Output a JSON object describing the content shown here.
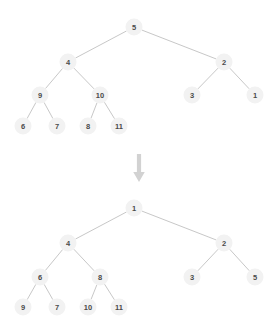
{
  "figure": {
    "background_color": "#ffffff",
    "node_fill_color": "#f2f2f2",
    "node_text_color": "#4a4a4a",
    "edge_color": "#b9b9b9",
    "arrow_color": "#d2d2d2",
    "node_radius": 8.5
  },
  "chart_data": {
    "type": "diagram",
    "title": "",
    "subtitle": "",
    "diagram_kind": "binary-tree-transformation",
    "transition_icon": "down-arrow-icon",
    "trees": [
      {
        "name": "before-tree",
        "root_value": "5",
        "nodes": [
          {
            "id": "t1-5",
            "label": "5",
            "x": 134,
            "y": 27,
            "depth": 0
          },
          {
            "id": "t1-4",
            "label": "4",
            "x": 68,
            "y": 62,
            "depth": 1
          },
          {
            "id": "t1-2",
            "label": "2",
            "x": 224,
            "y": 62,
            "depth": 1
          },
          {
            "id": "t1-9",
            "label": "9",
            "x": 40,
            "y": 95,
            "depth": 2
          },
          {
            "id": "t1-10",
            "label": "10",
            "x": 100,
            "y": 95,
            "depth": 2
          },
          {
            "id": "t1-3",
            "label": "3",
            "x": 192,
            "y": 95,
            "depth": 2
          },
          {
            "id": "t1-1",
            "label": "1",
            "x": 255,
            "y": 95,
            "depth": 2
          },
          {
            "id": "t1-6",
            "label": "6",
            "x": 23,
            "y": 126,
            "depth": 3
          },
          {
            "id": "t1-7",
            "label": "7",
            "x": 57,
            "y": 126,
            "depth": 3
          },
          {
            "id": "t1-8",
            "label": "8",
            "x": 88,
            "y": 126,
            "depth": 3
          },
          {
            "id": "t1-11",
            "label": "11",
            "x": 119,
            "y": 126,
            "depth": 3
          }
        ],
        "edges": [
          {
            "from": "t1-5",
            "to": "t1-4"
          },
          {
            "from": "t1-5",
            "to": "t1-2"
          },
          {
            "from": "t1-4",
            "to": "t1-9"
          },
          {
            "from": "t1-4",
            "to": "t1-10"
          },
          {
            "from": "t1-2",
            "to": "t1-3"
          },
          {
            "from": "t1-2",
            "to": "t1-1"
          },
          {
            "from": "t1-9",
            "to": "t1-6"
          },
          {
            "from": "t1-9",
            "to": "t1-7"
          },
          {
            "from": "t1-10",
            "to": "t1-8"
          },
          {
            "from": "t1-10",
            "to": "t1-11"
          }
        ]
      },
      {
        "name": "after-tree",
        "root_value": "1",
        "nodes": [
          {
            "id": "t2-1",
            "label": "1",
            "x": 134,
            "y": 208,
            "depth": 0
          },
          {
            "id": "t2-4",
            "label": "4",
            "x": 68,
            "y": 243,
            "depth": 1
          },
          {
            "id": "t2-2",
            "label": "2",
            "x": 224,
            "y": 243,
            "depth": 1
          },
          {
            "id": "t2-6",
            "label": "6",
            "x": 40,
            "y": 277,
            "depth": 2
          },
          {
            "id": "t2-8",
            "label": "8",
            "x": 100,
            "y": 277,
            "depth": 2
          },
          {
            "id": "t2-3",
            "label": "3",
            "x": 192,
            "y": 277,
            "depth": 2
          },
          {
            "id": "t2-5",
            "label": "5",
            "x": 255,
            "y": 277,
            "depth": 2
          },
          {
            "id": "t2-9",
            "label": "9",
            "x": 23,
            "y": 307,
            "depth": 3
          },
          {
            "id": "t2-7",
            "label": "7",
            "x": 57,
            "y": 307,
            "depth": 3
          },
          {
            "id": "t2-10",
            "label": "10",
            "x": 88,
            "y": 307,
            "depth": 3
          },
          {
            "id": "t2-11",
            "label": "11",
            "x": 119,
            "y": 307,
            "depth": 3
          }
        ],
        "edges": [
          {
            "from": "t2-1",
            "to": "t2-4"
          },
          {
            "from": "t2-1",
            "to": "t2-2"
          },
          {
            "from": "t2-4",
            "to": "t2-6"
          },
          {
            "from": "t2-4",
            "to": "t2-8"
          },
          {
            "from": "t2-2",
            "to": "t2-3"
          },
          {
            "from": "t2-2",
            "to": "t2-5"
          },
          {
            "from": "t2-6",
            "to": "t2-9"
          },
          {
            "from": "t2-6",
            "to": "t2-7"
          },
          {
            "from": "t2-8",
            "to": "t2-10"
          },
          {
            "from": "t2-8",
            "to": "t2-11"
          }
        ]
      }
    ],
    "arrow": {
      "name": "transition-arrow",
      "direction": "down",
      "x": 139,
      "y_top": 154,
      "y_bottom": 182
    }
  }
}
